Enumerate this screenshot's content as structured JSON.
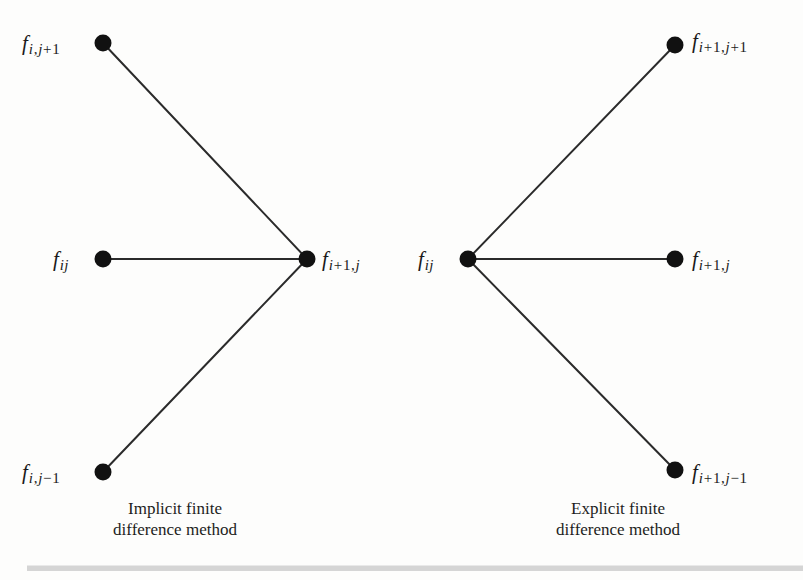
{
  "figure": {
    "type": "diagram",
    "background_color": "#fdfdfc",
    "node_color": "#111111",
    "edge_color": "#2b2b2b",
    "rule_color": "#cfcfcf"
  },
  "diagrams": [
    {
      "id": "implicit",
      "caption": "Implicit finite\ndifference method",
      "caption_x": 175,
      "caption_y": 498,
      "apex": {
        "x": 307,
        "y": 259
      },
      "nodes": [
        {
          "id": "i-j-plus-1",
          "x": 103,
          "y": 43,
          "symbol": "f",
          "subscript_parts": [
            {
              "text": "i",
              "kind": "var"
            },
            {
              "text": ",",
              "kind": "op"
            },
            {
              "text": "j",
              "kind": "var"
            },
            {
              "text": "+",
              "kind": "op"
            },
            {
              "text": "1",
              "kind": "num"
            }
          ],
          "label_side": "left",
          "label_x": 22,
          "label_y": 33
        },
        {
          "id": "i-j",
          "x": 103,
          "y": 259,
          "symbol": "f",
          "subscript_parts": [
            {
              "text": "i",
              "kind": "var"
            },
            {
              "text": "j",
              "kind": "var"
            }
          ],
          "label_side": "left",
          "label_x": 53,
          "label_y": 249
        },
        {
          "id": "i-j-minus-1",
          "x": 103,
          "y": 472,
          "symbol": "f",
          "subscript_parts": [
            {
              "text": "i",
              "kind": "var"
            },
            {
              "text": ",",
              "kind": "op"
            },
            {
              "text": "j",
              "kind": "var"
            },
            {
              "text": "−",
              "kind": "op"
            },
            {
              "text": "1",
              "kind": "num"
            }
          ],
          "label_side": "left",
          "label_x": 22,
          "label_y": 462
        },
        {
          "id": "i-plus-1-j-apex",
          "x": 307,
          "y": 259,
          "symbol": "f",
          "subscript_parts": [
            {
              "text": "i",
              "kind": "var"
            },
            {
              "text": "+",
              "kind": "op"
            },
            {
              "text": "1",
              "kind": "num"
            },
            {
              "text": ",",
              "kind": "op"
            },
            {
              "text": "j",
              "kind": "var"
            }
          ],
          "label_side": "right",
          "label_x": 322,
          "label_y": 249
        }
      ],
      "edges": [
        {
          "from": "i-j-plus-1",
          "to": "i-plus-1-j-apex"
        },
        {
          "from": "i-j",
          "to": "i-plus-1-j-apex"
        },
        {
          "from": "i-j-minus-1",
          "to": "i-plus-1-j-apex"
        }
      ]
    },
    {
      "id": "explicit",
      "caption": "Explicit finite\ndifference method",
      "caption_x": 618,
      "caption_y": 498,
      "apex": {
        "x": 468,
        "y": 259
      },
      "nodes": [
        {
          "id": "e-i-j-apex",
          "x": 468,
          "y": 259,
          "symbol": "f",
          "subscript_parts": [
            {
              "text": "i",
              "kind": "var"
            },
            {
              "text": "j",
              "kind": "var"
            }
          ],
          "label_side": "left",
          "label_x": 418,
          "label_y": 249
        },
        {
          "id": "e-i1-j1",
          "x": 675,
          "y": 45,
          "symbol": "f",
          "subscript_parts": [
            {
              "text": "i",
              "kind": "var"
            },
            {
              "text": "+",
              "kind": "op"
            },
            {
              "text": "1",
              "kind": "num"
            },
            {
              "text": ",",
              "kind": "op"
            },
            {
              "text": "j",
              "kind": "var"
            },
            {
              "text": "+",
              "kind": "op"
            },
            {
              "text": "1",
              "kind": "num"
            }
          ],
          "label_side": "right",
          "label_x": 692,
          "label_y": 31
        },
        {
          "id": "e-i1-j",
          "x": 675,
          "y": 259,
          "symbol": "f",
          "subscript_parts": [
            {
              "text": "i",
              "kind": "var"
            },
            {
              "text": "+",
              "kind": "op"
            },
            {
              "text": "1",
              "kind": "num"
            },
            {
              "text": ",",
              "kind": "op"
            },
            {
              "text": "j",
              "kind": "var"
            }
          ],
          "label_side": "right",
          "label_x": 692,
          "label_y": 249
        },
        {
          "id": "e-i1-jm1",
          "x": 675,
          "y": 470,
          "symbol": "f",
          "subscript_parts": [
            {
              "text": "i",
              "kind": "var"
            },
            {
              "text": "+",
              "kind": "op"
            },
            {
              "text": "1",
              "kind": "num"
            },
            {
              "text": ",",
              "kind": "op"
            },
            {
              "text": "j",
              "kind": "var"
            },
            {
              "text": "−",
              "kind": "op"
            },
            {
              "text": "1",
              "kind": "num"
            }
          ],
          "label_side": "right",
          "label_x": 692,
          "label_y": 462
        }
      ],
      "edges": [
        {
          "from": "e-i-j-apex",
          "to": "e-i1-j1"
        },
        {
          "from": "e-i-j-apex",
          "to": "e-i1-j"
        },
        {
          "from": "e-i-j-apex",
          "to": "e-i1-jm1"
        }
      ]
    }
  ],
  "rule": {
    "x": 27,
    "y": 565,
    "width": 776,
    "height": 6
  }
}
